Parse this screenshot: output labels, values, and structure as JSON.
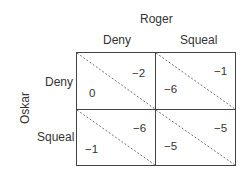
{
  "column_player": "Roger",
  "row_player": "Oskar",
  "column_strategies": [
    "Deny",
    "Squeal"
  ],
  "row_strategies": [
    "Deny",
    "Squeal"
  ],
  "cells": [
    {
      "row": "Deny",
      "col": "Deny",
      "oskar": "0",
      "roger": "−2"
    },
    {
      "row": "Deny",
      "col": "Squeal",
      "oskar": "−6",
      "roger": "−1"
    },
    {
      "row": "Squeal",
      "col": "Deny",
      "oskar": "−1",
      "roger": "−6"
    },
    {
      "row": "Squeal",
      "col": "Squeal",
      "oskar": "−5",
      "roger": "−5"
    }
  ]
}
